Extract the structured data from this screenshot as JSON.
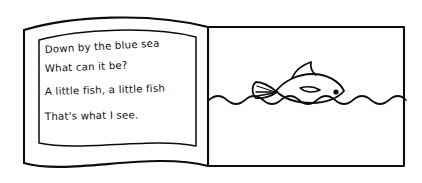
{
  "illustration": {
    "title": "Open picture book spread",
    "style": "hand-drawn black ink line art",
    "background_color": "#ffffff",
    "ink_color": "#0d0d0d"
  },
  "book": {
    "left_page": {
      "name": "left-page",
      "description": "curved page with poem text box"
    },
    "right_page": {
      "name": "right-page",
      "description": "rectangular page with sea scene"
    }
  },
  "poem": {
    "lines": [
      "Down by the blue sea",
      "What can it be?",
      "A little fish, a little fish",
      "That's what I see."
    ]
  },
  "scene": {
    "waterline_label": "wavy water surface",
    "fish_label": "little fish",
    "fish_parts": {
      "tail": "tail-fin",
      "dorsal": "dorsal-fin",
      "pectoral": "pectoral-fin",
      "eye": "eye"
    }
  }
}
